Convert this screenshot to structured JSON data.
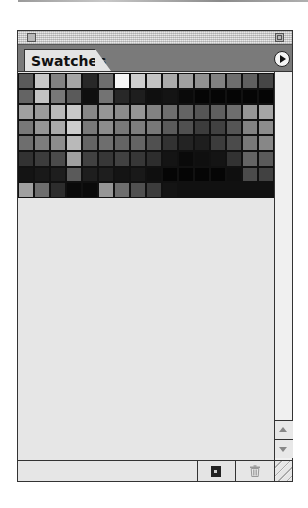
{
  "panel": {
    "tab_label": "Swatches",
    "menu_icon": "panel-menu-arrow-icon"
  },
  "swatches": {
    "columns": 16,
    "rows": [
      [
        90,
        200,
        130,
        165,
        40,
        110,
        245,
        205,
        195,
        170,
        160,
        145,
        130,
        110,
        95,
        70
      ],
      [
        100,
        195,
        120,
        90,
        15,
        115,
        40,
        30,
        15,
        20,
        10,
        5,
        5,
        5,
        5,
        5
      ],
      [
        160,
        155,
        185,
        200,
        135,
        150,
        140,
        150,
        130,
        110,
        100,
        85,
        95,
        110,
        150,
        165
      ],
      [
        120,
        150,
        170,
        205,
        120,
        140,
        120,
        125,
        120,
        90,
        80,
        60,
        65,
        85,
        130,
        140
      ],
      [
        110,
        125,
        140,
        185,
        100,
        110,
        100,
        100,
        80,
        50,
        35,
        30,
        60,
        75,
        120,
        135
      ],
      [
        50,
        60,
        75,
        160,
        65,
        55,
        65,
        55,
        45,
        20,
        10,
        15,
        20,
        50,
        100,
        90
      ],
      [
        20,
        25,
        30,
        90,
        30,
        30,
        20,
        25,
        15,
        5,
        5,
        5,
        5,
        15,
        75,
        65
      ],
      [
        160,
        110,
        45,
        10,
        10,
        150,
        110,
        80,
        60,
        20
      ]
    ]
  },
  "scrollbar": {
    "up_icon": "scroll-up-arrow-icon",
    "down_icon": "scroll-down-arrow-icon"
  },
  "bottom_bar": {
    "new_swatch_icon": "new-swatch-icon",
    "delete_swatch_icon": "trash-icon",
    "resize_icon": "resize-grip-icon"
  },
  "colors": {
    "panel_bg": "#e6e6e6",
    "tab_strip": "#7a7a7a",
    "border": "#333333"
  }
}
